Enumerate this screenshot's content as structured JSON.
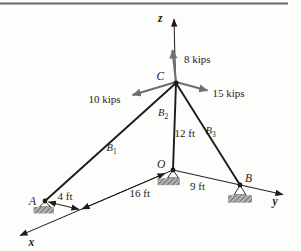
{
  "diagram": {
    "axis_labels": {
      "x": "x",
      "y": "y",
      "z": "z"
    },
    "point_labels": {
      "A": "A",
      "B": "B",
      "C": "C",
      "O": "O"
    },
    "force_labels": {
      "vertical": "8 kips",
      "left": "10 kips",
      "right": "15 kips"
    },
    "dimension_labels": {
      "c_to_o": "12 ft",
      "o_to_b": "9 ft",
      "o_to_junction": "16 ft",
      "a_to_junction": "4 ft"
    },
    "cable_labels": {
      "b1": {
        "base": "B",
        "sub": "1"
      },
      "b2": {
        "base": "B",
        "sub": "2"
      },
      "b3": {
        "base": "B",
        "sub": "3"
      }
    },
    "colors": {
      "line": "#1c1c1c",
      "force_arrow": "#6e6e6e",
      "pad_fill": "#b3b3b3",
      "pad_hatch": "#757575",
      "top_rule": "#6a6a6a"
    }
  }
}
